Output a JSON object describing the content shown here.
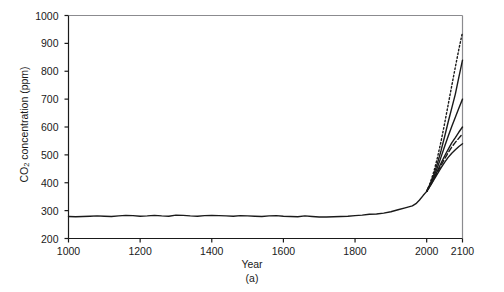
{
  "figure": {
    "caption": "(a)",
    "title_fragment": "",
    "background": "#ffffff",
    "ink_color": "#1a1a1a"
  },
  "chart_data": {
    "type": "line",
    "title": "",
    "xlabel": "Year",
    "ylabel": "CO2 concentration (ppm)",
    "ylabel_html": "CO<sub>2</sub> concentration (ppm)",
    "xlim": [
      1000,
      2100
    ],
    "ylim": [
      200,
      1000
    ],
    "xticks": [
      1000,
      1200,
      1400,
      1600,
      1800,
      2000,
      2100
    ],
    "xtick_labels": [
      "1000",
      "1200",
      "1400",
      "1600",
      "1800",
      "2000",
      "2100"
    ],
    "yticks": [
      200,
      300,
      400,
      500,
      600,
      700,
      800,
      900,
      1000
    ],
    "ytick_labels": [
      "200",
      "300",
      "400",
      "500",
      "600",
      "700",
      "800",
      "900",
      "1000"
    ],
    "grid": false,
    "legend": "none",
    "axis_style": "left-and-bottom-spine-with-outward-ticks",
    "series": [
      {
        "name": "Observed / reconstructed CO2",
        "style": "solid",
        "width": 1.4,
        "color": "#1a1a1a",
        "x": [
          1000,
          1020,
          1040,
          1060,
          1080,
          1100,
          1120,
          1140,
          1160,
          1180,
          1200,
          1220,
          1240,
          1260,
          1280,
          1300,
          1320,
          1340,
          1360,
          1380,
          1400,
          1420,
          1440,
          1460,
          1480,
          1500,
          1520,
          1540,
          1560,
          1580,
          1600,
          1620,
          1640,
          1660,
          1680,
          1700,
          1720,
          1740,
          1760,
          1780,
          1800,
          1820,
          1840,
          1860,
          1880,
          1900,
          1920,
          1940,
          1960,
          1970,
          1980,
          1990,
          2000
        ],
        "y": [
          279,
          278,
          279,
          280,
          281,
          280,
          279,
          281,
          283,
          282,
          280,
          281,
          283,
          281,
          280,
          284,
          283,
          281,
          280,
          282,
          283,
          282,
          281,
          280,
          282,
          281,
          280,
          279,
          281,
          282,
          280,
          279,
          278,
          281,
          279,
          277,
          277,
          278,
          279,
          280,
          282,
          284,
          287,
          288,
          291,
          296,
          303,
          310,
          317,
          325,
          338,
          354,
          369
        ]
      },
      {
        "name": "Scenario projection A (highest, dotted)",
        "style": "dotted",
        "width": 1.4,
        "color": "#1a1a1a",
        "x": [
          2000,
          2010,
          2020,
          2030,
          2040,
          2050,
          2060,
          2070,
          2080,
          2090,
          2100
        ],
        "y": [
          369,
          400,
          440,
          490,
          548,
          612,
          680,
          748,
          815,
          880,
          940
        ]
      },
      {
        "name": "Scenario projection B",
        "style": "solid",
        "width": 1.4,
        "color": "#1a1a1a",
        "x": [
          2000,
          2010,
          2020,
          2030,
          2040,
          2050,
          2060,
          2070,
          2080,
          2090,
          2100
        ],
        "y": [
          369,
          396,
          430,
          470,
          515,
          565,
          618,
          668,
          718,
          780,
          840
        ]
      },
      {
        "name": "Scenario projection C",
        "style": "solid",
        "width": 1.4,
        "color": "#1a1a1a",
        "x": [
          2000,
          2010,
          2020,
          2030,
          2040,
          2050,
          2060,
          2070,
          2080,
          2090,
          2100
        ],
        "y": [
          369,
          393,
          422,
          455,
          492,
          530,
          567,
          602,
          635,
          668,
          700
        ]
      },
      {
        "name": "Scenario projection D",
        "style": "solid",
        "width": 1.4,
        "color": "#1a1a1a",
        "x": [
          2000,
          2010,
          2020,
          2030,
          2040,
          2050,
          2060,
          2070,
          2080,
          2090,
          2100
        ],
        "y": [
          369,
          391,
          416,
          443,
          470,
          496,
          520,
          543,
          562,
          582,
          600
        ]
      },
      {
        "name": "Scenario projection E (dashed)",
        "style": "dashed",
        "width": 1.4,
        "color": "#1a1a1a",
        "x": [
          2000,
          2010,
          2020,
          2030,
          2040,
          2050,
          2060,
          2070,
          2080,
          2090,
          2100
        ],
        "y": [
          369,
          390,
          413,
          438,
          462,
          486,
          508,
          528,
          545,
          560,
          575
        ]
      },
      {
        "name": "Scenario projection F (lowest)",
        "style": "solid",
        "width": 1.4,
        "color": "#1a1a1a",
        "x": [
          2000,
          2010,
          2020,
          2030,
          2040,
          2050,
          2060,
          2070,
          2080,
          2090,
          2100
        ],
        "y": [
          369,
          389,
          410,
          432,
          453,
          473,
          491,
          506,
          518,
          530,
          540
        ]
      }
    ]
  }
}
